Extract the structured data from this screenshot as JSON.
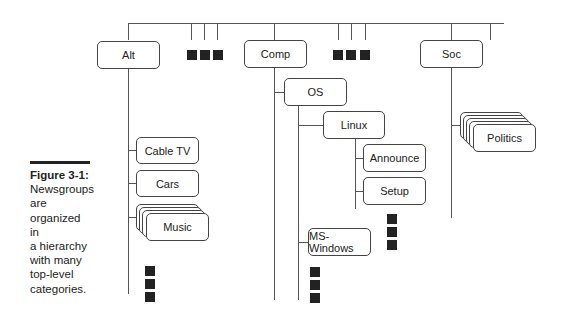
{
  "caption": {
    "label": "Figure 3-1:",
    "text": [
      "Newsgroups",
      "are",
      "organized in",
      "a hierarchy",
      "with many",
      "top-level",
      "categories."
    ]
  },
  "diagram": {
    "top_level": [
      {
        "label": "Alt"
      },
      {
        "label": "Comp"
      },
      {
        "label": "Soc"
      }
    ],
    "alt_children": [
      {
        "label": "Cable TV"
      },
      {
        "label": "Cars"
      },
      {
        "label": "Music",
        "stacked": true
      }
    ],
    "comp_children": [
      {
        "label": "OS"
      }
    ],
    "os_children": [
      {
        "label": "Linux"
      },
      {
        "label": "MS-Windows"
      }
    ],
    "linux_children": [
      {
        "label": "Announce"
      },
      {
        "label": "Setup"
      }
    ],
    "soc_children": [
      {
        "label": "Politics",
        "stacked": true
      }
    ],
    "more_indicator": "ellipsis-squares"
  }
}
